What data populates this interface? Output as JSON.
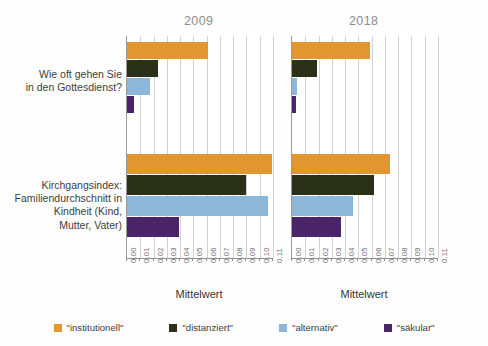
{
  "chart_data": {
    "type": "bar",
    "orientation": "horizontal",
    "title": "",
    "xlabel": "Mittelwert",
    "ylabel": "",
    "xlim": [
      0.0,
      0.11
    ],
    "grid": true,
    "legend_position": "bottom",
    "panels": [
      {
        "title": "2009",
        "xlabel": "Mittelwert",
        "categories": [
          "Wie oft gehen Sie\nin den Gottesdienst?",
          "Kirchgangsindex:\nFamiliendurchschnitt in\nKindheit (Kind,\nMutter, Vater)"
        ],
        "series": [
          {
            "name": "\"institutionell\"",
            "color": "#E0972F",
            "values": [
              0.061,
              0.109
            ]
          },
          {
            "name": "\"distanziert\"",
            "color": "#2B3019",
            "values": [
              0.023,
              0.09
            ]
          },
          {
            "name": "\"alternativ\"",
            "color": "#8DB6D8",
            "values": [
              0.017,
              0.106
            ]
          },
          {
            "name": "\"säkular\"",
            "color": "#4A2468",
            "values": [
              0.005,
              0.039
            ]
          }
        ],
        "xticks": [
          "0.00",
          "0.01",
          "0.02",
          "0.03",
          "0.04",
          "0.05",
          "0.06",
          "0.07",
          "0.08",
          "0.09",
          "0.10",
          "0.11"
        ]
      },
      {
        "title": "2018",
        "xlabel": "Mittelwert",
        "categories": [
          "Wie oft gehen Sie\nin den Gottesdienst?",
          "Kirchgangsindex:\nFamiliendurchschnitt in\nKindheit (Kind,\nMutter, Vater)"
        ],
        "series": [
          {
            "name": "\"institutionell\"",
            "color": "#E0972F",
            "values": [
              0.059,
              0.074
            ]
          },
          {
            "name": "\"distanziert\"",
            "color": "#2B3019",
            "values": [
              0.019,
              0.062
            ]
          },
          {
            "name": "\"alternativ\"",
            "color": "#8DB6D8",
            "values": [
              0.004,
              0.046
            ]
          },
          {
            "name": "\"säkular\"",
            "color": "#4A2468",
            "values": [
              0.003,
              0.037
            ]
          }
        ],
        "xticks": [
          "0.00",
          "0.01",
          "0.02",
          "0.03",
          "0.04",
          "0.05",
          "0.06",
          "0.07",
          "0.08",
          "0.09",
          "0.10",
          "0.11"
        ]
      }
    ],
    "legend": [
      {
        "label": "\"institutionell\"",
        "color": "#E0972F"
      },
      {
        "label": "\"distanziert\"",
        "color": "#2B3019"
      },
      {
        "label": "\"alternativ\"",
        "color": "#8DB6D8"
      },
      {
        "label": "\"säkular\"",
        "color": "#4A2468"
      }
    ]
  },
  "panel_left": {
    "title": "2009",
    "axis_title": "Mittelwert"
  },
  "panel_right": {
    "title": "2018",
    "axis_title": "Mittelwert"
  },
  "categories": {
    "top": "Wie oft gehen Sie\nin den Gottesdienst?",
    "bottom": "Kirchgangsindex:\nFamiliendurchschnitt in\nKindheit (Kind,\nMutter, Vater)"
  },
  "legend": {
    "items": [
      {
        "label": "\"institutionell\""
      },
      {
        "label": "\"distanziert\""
      },
      {
        "label": "\"alternativ\""
      },
      {
        "label": "\"säkular\""
      }
    ]
  }
}
